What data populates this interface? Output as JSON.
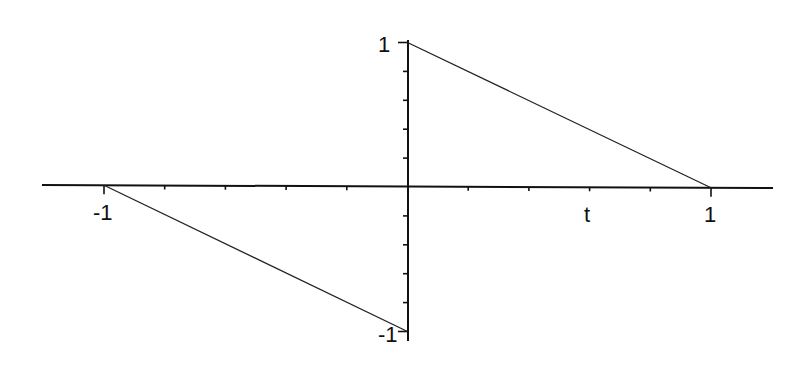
{
  "chart_data": {
    "type": "line",
    "title": "",
    "xlabel": "t",
    "ylabel": "",
    "xlim": [
      -1.2,
      1.2
    ],
    "ylim": [
      -1.05,
      1.05
    ],
    "grid": false,
    "legend": null,
    "x_tick_labels": [
      "-1",
      "1"
    ],
    "y_tick_labels": [
      "1",
      "-1"
    ],
    "x_tick_step": 0.2,
    "y_tick_step": 0.2,
    "series": [
      {
        "name": "segment-negative",
        "x": [
          -1,
          0
        ],
        "y": [
          0,
          -1
        ]
      },
      {
        "name": "segment-positive",
        "x": [
          0,
          1
        ],
        "y": [
          1,
          0
        ]
      }
    ],
    "annotations": [
      {
        "text": "t",
        "x": 0.6,
        "y": 0,
        "position": "below-axis"
      }
    ]
  },
  "labels": {
    "x_neg1": "-1",
    "x_pos1": "1",
    "x_axis_name": "t",
    "y_pos1": "1",
    "y_neg1": "-1"
  }
}
